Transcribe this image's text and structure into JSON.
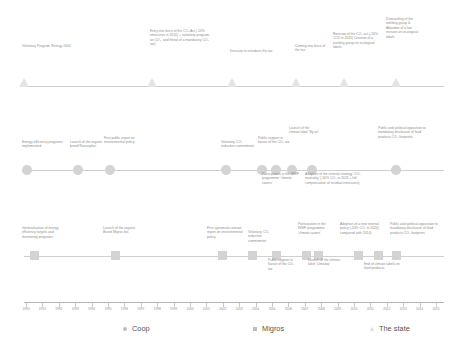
{
  "rows": {
    "state": {
      "name": "The state",
      "marker": "triangle-marker",
      "events": [
        {
          "id": "voluntary-program-energy-2000",
          "text": "Voluntary Program ‘Energy 2000’",
          "x": 24,
          "label_x": 22,
          "label_y": 44,
          "label_w": 58
        },
        {
          "id": "co2-act-entry-into-force",
          "text": "Entry into force of the CO₂ Act (-10% emissions in 2010) + voluntary program on CO₂, and threat of a mandatory CO₂ tax)",
          "x": 152,
          "label_x": 150,
          "label_y": 29,
          "label_w": 62
        },
        {
          "id": "decision-to-introduce-the-tax",
          "text": "Decision to introduce the tax",
          "x": 232,
          "label_x": 230,
          "label_y": 49,
          "label_w": 52
        },
        {
          "id": "coming-into-force-of-the-tax",
          "text": "Coming into force of the tax",
          "x": 296,
          "label_x": 295,
          "label_y": 44,
          "label_w": 34
        },
        {
          "id": "co2-act-revision",
          "text": "Revision of the CO₂ act (-20% CO2 in 2020) Creation of a working group on ecological labels",
          "x": 344,
          "label_x": 333,
          "label_y": 32,
          "label_w": 50
        },
        {
          "id": "dismantling-working-group",
          "text": "Dismantling of the working group & Abandon of a law revision on ecological labels",
          "x": 396,
          "label_x": 386,
          "label_y": 17,
          "label_w": 33
        }
      ]
    },
    "coop": {
      "name": "Coop",
      "marker": "circle-marker",
      "events_above": [
        {
          "id": "energy-efficiency-programs",
          "text": "Energy efficiency programs implemented",
          "x": 27,
          "label_x": 22,
          "label_y": 140,
          "label_w": 42
        },
        {
          "id": "launch-naturaplan",
          "text": "Launch of the organic brand Naturaplan",
          "x": 78,
          "label_x": 70,
          "label_y": 140,
          "label_w": 40
        },
        {
          "id": "first-public-report",
          "text": "First public report on environmental policy",
          "x": 110,
          "label_x": 104,
          "label_y": 136,
          "label_w": 36
        },
        {
          "id": "voluntary-co2-commitment",
          "text": "Voluntary CO₂ reduction commitment",
          "x": 226,
          "label_x": 221,
          "label_y": 140,
          "label_w": 36
        },
        {
          "id": "public-support-co2-tax",
          "text": "Public support in favour of the CO₂ tax",
          "x": 262,
          "label_x": 258,
          "label_y": 136,
          "label_w": 32
        },
        {
          "id": "launch-climate-label-by-air",
          "text": "Launch of the climate label ‘By air’",
          "x": 292,
          "label_x": 289,
          "label_y": 126,
          "label_w": 30
        },
        {
          "id": "public-political-opposition",
          "text": "Public and political opposition to mandatory disclosure of food products CO₂ footprints",
          "x": 396,
          "label_x": 378,
          "label_y": 126,
          "label_w": 56
        }
      ],
      "events_below": [
        {
          "id": "wwf-climate-savers-coop",
          "text": "Participation in the WWF programme ‘climate savers’",
          "x": 276,
          "label_x": 262,
          "label_y": 172,
          "label_w": 38
        },
        {
          "id": "internal-strategy-co2-neutrality",
          "text": "Adoption of the internal strategy ‘CO₂ neutrality’ (-50% CO₂ in 2023 + full compensation of residual emissions)",
          "x": 312,
          "label_x": 305,
          "label_y": 172,
          "label_w": 64
        }
      ]
    },
    "migros": {
      "name": "Migros",
      "marker": "square-marker",
      "events_above": [
        {
          "id": "generalisation-energy-targets",
          "text": "Generalisation of energy efficiency targets and monitoring programs",
          "x": 34,
          "label_x": 22,
          "label_y": 226,
          "label_w": 48
        },
        {
          "id": "launch-migros-bio",
          "text": "Launch of the organic Brand Migros bio",
          "x": 115,
          "label_x": 103,
          "label_y": 226,
          "label_w": 38
        },
        {
          "id": "first-systematic-annual-report",
          "text": "First systematic annual report on environmental policy",
          "x": 222,
          "label_x": 207,
          "label_y": 226,
          "label_w": 38
        },
        {
          "id": "voluntary-co2-commitment-migros",
          "text": "Voluntary CO₂ reduction commitment",
          "x": 252,
          "label_x": 248,
          "label_y": 230,
          "label_w": 33
        },
        {
          "id": "wwf-climate-savers-migros",
          "text": "Participation in the WWF programme ‘climate savers’",
          "x": 306,
          "label_x": 298,
          "label_y": 222,
          "label_w": 34
        },
        {
          "id": "new-internal-policy-migros",
          "text": "Adoption of a new internal policy (-20% CO₂ in 2020) compared with 2010)",
          "x": 358,
          "label_x": 340,
          "label_y": 222,
          "label_w": 46
        },
        {
          "id": "public-political-opposition-migros",
          "text": "Public and political opposition to mandatory disclosure of food products CO₂ footprints",
          "x": 396,
          "label_x": 390,
          "label_y": 222,
          "label_w": 54
        }
      ],
      "events_below": [
        {
          "id": "public-support-co2-tax-migros",
          "text": "Public support in favour of the CO₂ tax",
          "x": 276,
          "label_x": 268,
          "label_y": 258,
          "label_w": 28
        },
        {
          "id": "launch-climate-label-climatop",
          "text": "Launch of the climate label ‘climatop’",
          "x": 318,
          "label_x": 308,
          "label_y": 258,
          "label_w": 40
        },
        {
          "id": "end-of-climate-labels",
          "text": "End of climate labels on food products",
          "x": 378,
          "label_x": 364,
          "label_y": 262,
          "label_w": 38
        }
      ]
    }
  },
  "axis": {
    "years": [
      "1990",
      "1991",
      "1992",
      "1993",
      "1994",
      "1995",
      "1996",
      "1997",
      "1998",
      "1999",
      "2000",
      "2001",
      "2002",
      "2003",
      "2004",
      "2005",
      "2006",
      "2007",
      "2008",
      "2009",
      "2010",
      "2011",
      "2012",
      "2013",
      "2014",
      "2015"
    ],
    "start_x": 26,
    "step": 16.4
  },
  "legend": {
    "items": [
      {
        "id": "legend-coop",
        "label": "Coop",
        "marker": "circle-marker",
        "x": 123
      },
      {
        "id": "legend-migros",
        "label": "Migros",
        "marker": "square-marker",
        "x": 253
      },
      {
        "id": "legend-state",
        "label": "The state",
        "marker": "triangle-marker",
        "x": 370
      }
    ]
  }
}
